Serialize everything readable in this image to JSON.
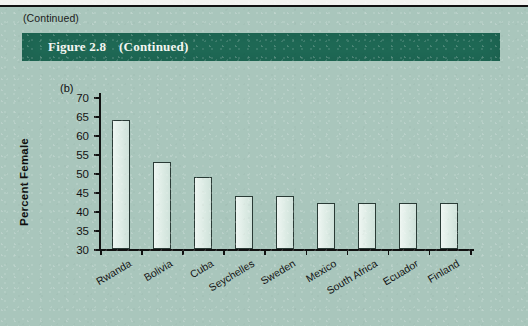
{
  "page": {
    "continued_note": "(Continued)",
    "background_color": "#a9c6bc"
  },
  "banner": {
    "figure_number": "Figure 2.8",
    "continued": "(Continued)",
    "color": "#1f6b57"
  },
  "chart_data": {
    "type": "bar",
    "panel": "(b)",
    "title": "",
    "xlabel": "",
    "ylabel": "Percent Female",
    "categories": [
      "Rwanda",
      "Bolivia",
      "Cuba",
      "Seychelles",
      "Sweden",
      "Mexico",
      "South Africa",
      "Ecuador",
      "Finland"
    ],
    "values": [
      64,
      53,
      49,
      44,
      44,
      42,
      42,
      42,
      42
    ],
    "ylim": [
      30,
      70
    ],
    "yticks": [
      30,
      35,
      40,
      45,
      50,
      55,
      60,
      65,
      70
    ],
    "ytick_labels": [
      "30",
      "35",
      "40",
      "45",
      "50",
      "55",
      "60",
      "65",
      "70"
    ],
    "grid": false,
    "legend": false,
    "bar_fill_color": "#e4efe9",
    "bar_edge_color": "#2a3b36"
  }
}
